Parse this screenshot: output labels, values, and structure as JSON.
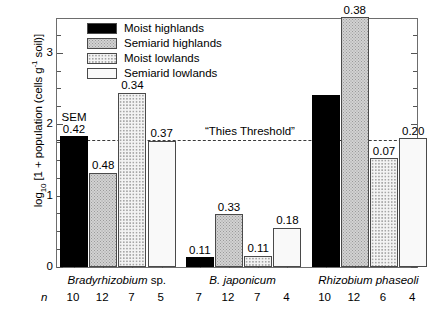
{
  "chart_data": {
    "type": "bar",
    "title": "",
    "xlabel": "",
    "ylabel_parts": {
      "prefix": "log",
      "sub": "10",
      "mid": " [1 + population (cells g",
      "sup": "-1",
      "suffix": " soil)]"
    },
    "ylabel": "log10 [1 + population (cells g-1 soil)]",
    "ylim": [
      0,
      3.5
    ],
    "yticks_major": [
      0,
      1,
      2,
      3
    ],
    "yticks_major_labels": [
      "0",
      "1",
      "2",
      "3"
    ],
    "yticks_minor": [
      0.25,
      0.5,
      0.75,
      1.25,
      1.5,
      1.75,
      2.25,
      2.5,
      2.75,
      3.25
    ],
    "grid": false,
    "legend_position": "top-left",
    "legend": [
      {
        "label": "Moist highlands",
        "fill": "solid-black"
      },
      {
        "label": "Semiarid highlands",
        "fill": "gray-stipple"
      },
      {
        "label": "Moist lowlands",
        "fill": "light-dots"
      },
      {
        "label": "Semiarid lowlands",
        "fill": "faint-dots"
      }
    ],
    "categories": [
      "Bradyrhizobium sp.",
      "B. japonicum",
      "Rhizobium phaseoli"
    ],
    "categories_display": [
      {
        "italic": "Bradyrhizobium",
        "roman": " sp."
      },
      {
        "italic": "B. japonicum",
        "roman": ""
      },
      {
        "italic": "Rhizobium phaseoli",
        "roman": ""
      }
    ],
    "series": [
      {
        "name": "Moist highlands",
        "values": [
          1.83,
          0.14,
          2.41
        ]
      },
      {
        "name": "Semiarid highlands",
        "values": [
          1.32,
          0.74,
          3.5
        ]
      },
      {
        "name": "Moist lowlands",
        "values": [
          2.44,
          0.16,
          1.52
        ]
      },
      {
        "name": "Semiarid lowlands",
        "values": [
          1.77,
          0.55,
          1.8
        ]
      }
    ],
    "sem_labels": [
      [
        "0.42",
        "0.48",
        "0.34",
        "0.37"
      ],
      [
        "0.11",
        "0.33",
        "0.11",
        "0.18"
      ],
      [
        "",
        "0.38",
        "0.07",
        "0.20"
      ]
    ],
    "sem_word": "SEM",
    "n_label": "n",
    "n_values": [
      [
        "10",
        "12",
        "7",
        "5"
      ],
      [
        "7",
        "12",
        "7",
        "4"
      ],
      [
        "10",
        "12",
        "6",
        "4"
      ]
    ],
    "annotations": [
      {
        "name": "thies-threshold",
        "text": "“Thies Threshold”",
        "y": 1.77
      }
    ]
  }
}
